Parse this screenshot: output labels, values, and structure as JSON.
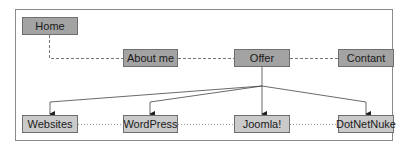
{
  "diagram": {
    "type": "site-map",
    "colors": {
      "top_nodes_fill": "#a3a3a3",
      "bottom_nodes_fill": "#cacaca",
      "border": "#6f6f6f",
      "frame": "#8a8a8a",
      "line": "#555555"
    },
    "root": {
      "label": "Home"
    },
    "level1": [
      {
        "label": "About me"
      },
      {
        "label": "Offer"
      },
      {
        "label": "Contant"
      }
    ],
    "level2": [
      {
        "label": "Websites"
      },
      {
        "label": "WordPress"
      },
      {
        "label": "Joomla!"
      },
      {
        "label": "DotNetNuke"
      }
    ],
    "edges": [
      {
        "from": "Home",
        "to": "About me",
        "style": "dashed"
      },
      {
        "from": "About me",
        "to": "Offer",
        "style": "dashed"
      },
      {
        "from": "Offer",
        "to": "Contant",
        "style": "dashed"
      },
      {
        "from": "Offer",
        "to": "Websites",
        "style": "arrow"
      },
      {
        "from": "Offer",
        "to": "WordPress",
        "style": "arrow"
      },
      {
        "from": "Offer",
        "to": "Joomla!",
        "style": "arrow"
      },
      {
        "from": "Offer",
        "to": "DotNetNuke",
        "style": "arrow"
      },
      {
        "from": "Websites",
        "to": "WordPress",
        "style": "dotted"
      },
      {
        "from": "WordPress",
        "to": "Joomla!",
        "style": "dotted"
      },
      {
        "from": "Joomla!",
        "to": "DotNetNuke",
        "style": "dotted"
      }
    ]
  }
}
